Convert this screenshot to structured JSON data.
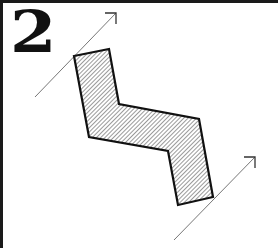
{
  "figure": {
    "label": "2",
    "colors": {
      "border": "#1a1a1a",
      "outline": "#111111",
      "hatch": "#555555",
      "arrow": "#777777",
      "background": "#ffffff"
    },
    "shape": {
      "type": "hatched-polygon",
      "points": [
        [
          74,
          56
        ],
        [
          109,
          49
        ],
        [
          119,
          104
        ],
        [
          199,
          119
        ],
        [
          213,
          197
        ],
        [
          178,
          205
        ],
        [
          168,
          151
        ],
        [
          89,
          137
        ]
      ]
    },
    "arrows": [
      {
        "name": "top-arrow",
        "from": [
          35,
          97
        ],
        "to": [
          116,
          13
        ]
      },
      {
        "name": "bottom-arrow",
        "from": [
          174,
          240
        ],
        "to": [
          255,
          157
        ]
      }
    ]
  }
}
